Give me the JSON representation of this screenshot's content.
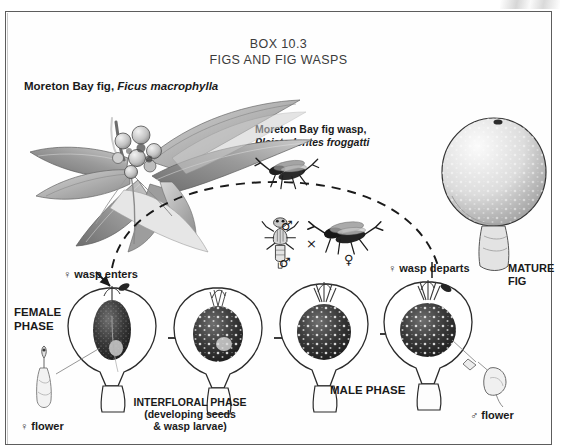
{
  "box": {
    "title_line1": "BOX 10.3",
    "title_line2": "FIGS AND FIG WASPS"
  },
  "organisms": {
    "plant_common": "Moreton Bay fig,",
    "plant_species": " Ficus macrophylla",
    "wasp_common": "Moreton Bay fig wasp,",
    "wasp_species": "Pleistodontes froggatti"
  },
  "symbols": {
    "female": "♀",
    "male": "♂",
    "cross": "×"
  },
  "labels": {
    "wasp_enters": "♀ wasp enters",
    "wasp_departs": "♀ wasp departs",
    "mature_fig": "MATURE FIG",
    "female_phase": "FEMALE PHASE",
    "interfloral_phase_l1": "INTERFLORAL PHASE",
    "interfloral_phase_l2": "(developing seeds",
    "interfloral_phase_l3": "& wasp larvae)",
    "male_phase": "MALE PHASE",
    "female_flower": "♀ flower",
    "male_flower": "♂ flower",
    "mating_male": "♂",
    "mating_cross": "×",
    "mating_female": "♀"
  },
  "colors": {
    "page_background": "#ffffff",
    "frame_border": "#5d5d5d",
    "ink": "#1a1a1a",
    "title_ink": "#3b3b3b",
    "art_light": "#b9b9b9",
    "art_mid": "#7a7a7a",
    "art_dark": "#2e2e2e"
  },
  "diagram": {
    "type": "life-cycle",
    "stage_count": 4,
    "stage_order": [
      "female-phase",
      "interfloral-phase",
      "male-phase-early",
      "male-phase-late"
    ],
    "arrow_count": 3,
    "migration_path": "dashed arc from departing fig to receptive fig"
  }
}
